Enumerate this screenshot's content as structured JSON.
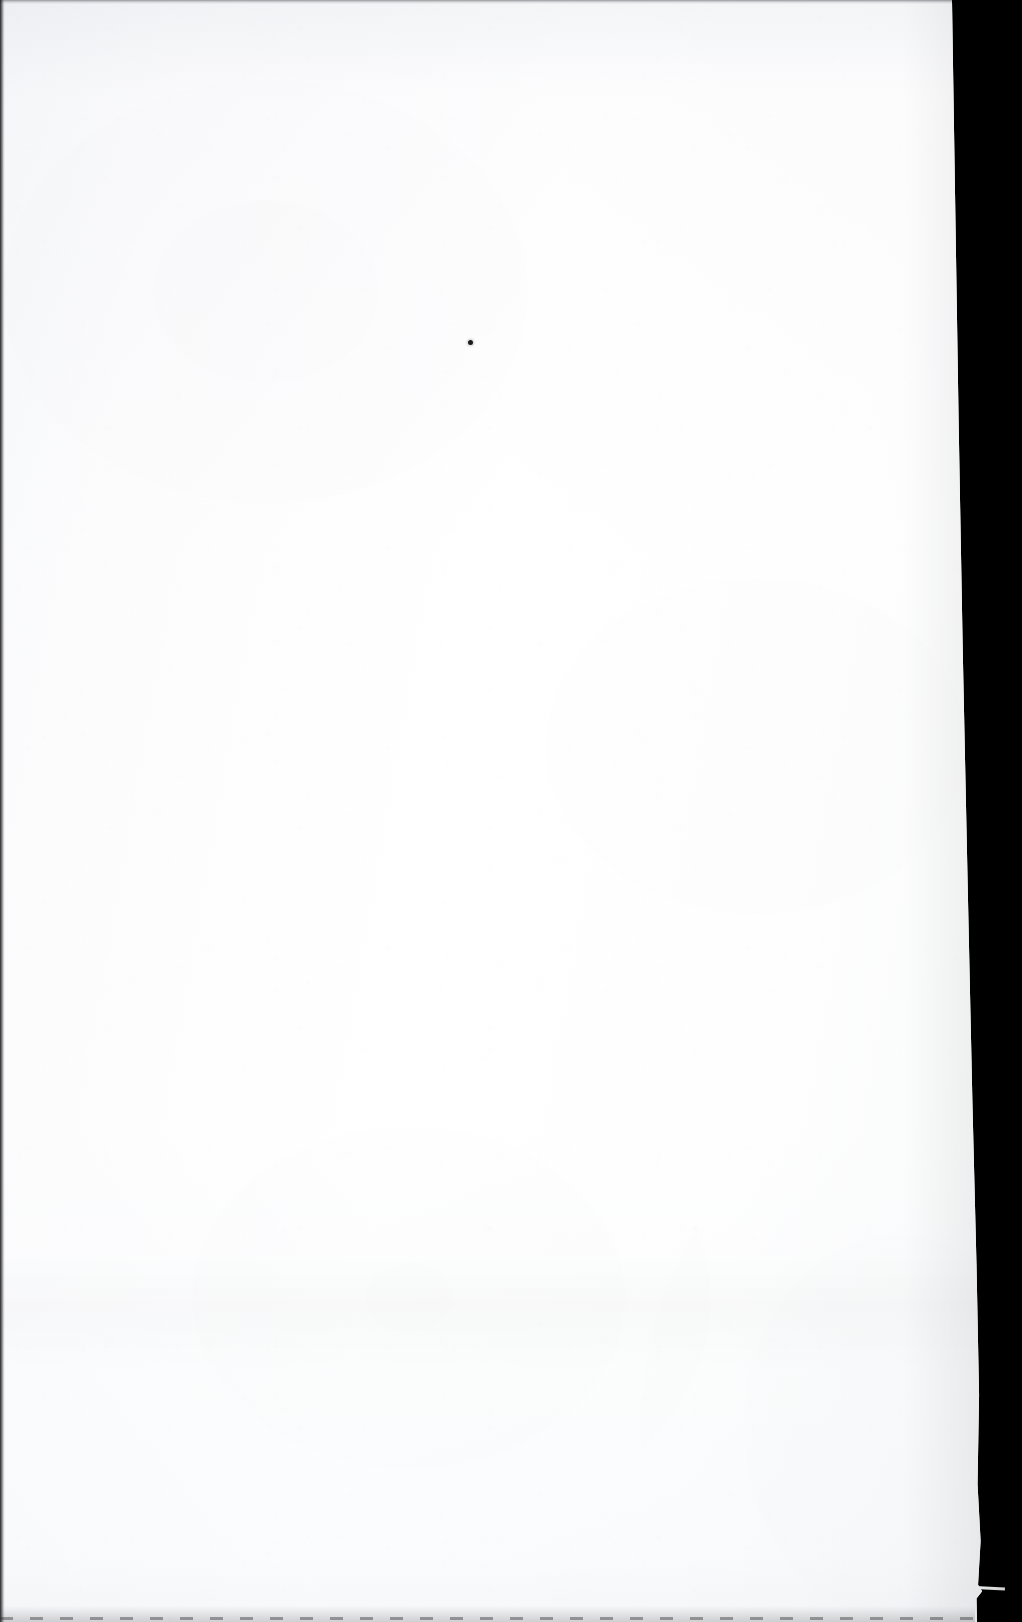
{
  "document": {
    "kind": "scanned-page",
    "title": "",
    "body_text": "",
    "page_number": "",
    "caption": "",
    "is_blank": true,
    "note": ""
  },
  "canvas": {
    "width_px": 1022,
    "height_px": 1622
  },
  "colors": {
    "paper": "#fdfdfd",
    "paper_highlight": "#ffffff",
    "paper_shadow": "#f4f5f7",
    "backdrop": "#000000",
    "edge_line": "#141416",
    "ink_speck": "#1b1b1e"
  },
  "page_edges": {
    "left_edge_label": "left scan border",
    "top_edge_label": "top scan border",
    "right_edge_label": "paper outer edge",
    "bottom_edge_label": "bottom dotted scan line",
    "right_edge_top_x": 952,
    "right_edge_bottom_x": 982
  },
  "marks": [
    {
      "name": "ink-speck",
      "x": 470,
      "y": 342,
      "size": 5
    }
  ],
  "regions": {
    "paper_label": "paper sheet",
    "backdrop_label": "scanner backdrop",
    "text_block_label": "empty text block"
  }
}
